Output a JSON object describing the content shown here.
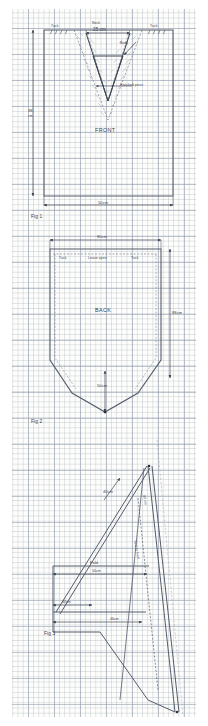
{
  "document": {
    "kind": "hand-drawn sewing pattern on graph paper",
    "background_color": "#fdfdfb",
    "grid_color": "#96a0af",
    "ink_color": "#3b4250"
  },
  "fig1": {
    "caption": "Fig 1",
    "piece_label": "FRONT",
    "neck_label": "Neck",
    "neck_width": "25 cm",
    "tuck_left": "Tuck",
    "tuck_right": "Tuck",
    "body_label": "Body",
    "finished_piece": "Finished piece",
    "height_value": "38",
    "height_unit": "cm",
    "width_value": "50cm"
  },
  "fig2": {
    "caption": "Fig 2",
    "piece_label": "BACK",
    "top_width": "80cm",
    "tuck_left": "Tuck",
    "leave_open": "Leave open",
    "tuck_right": "Tuck",
    "side_height": "88cm",
    "point_depth": "50cm"
  },
  "fig3": {
    "caption": "Fig 3",
    "fold_label": "Fold",
    "fold_width": "50cm",
    "diagonal_upper": "40cm",
    "side_seam_label": "Sew to front",
    "side_height": "80 cm",
    "lower_width": "40cm",
    "hem_width": "46cm"
  }
}
